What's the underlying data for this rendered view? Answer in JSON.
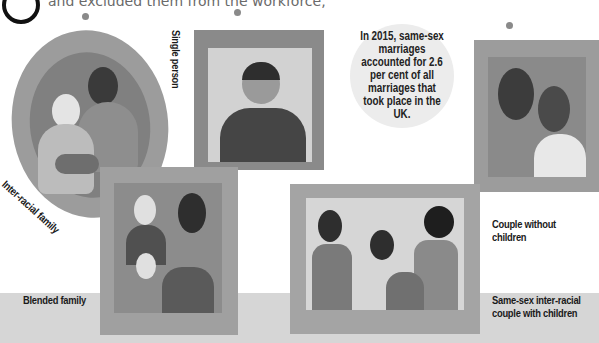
{
  "header": {
    "intro_text_clipped": "and excluded them from the workforce,"
  },
  "fact": {
    "text": "In 2015, same-sex marriages accounted for 2.6 per cent of all marriages that took place in the UK."
  },
  "frames": [
    {
      "id": "inter-racial",
      "label": "Inter-racial family"
    },
    {
      "id": "single",
      "label": "Single person"
    },
    {
      "id": "couple",
      "label": "Couple without children"
    },
    {
      "id": "blended",
      "label": "Blended family"
    },
    {
      "id": "same-sex",
      "label": "Same-sex inter-racial couple with children"
    }
  ],
  "colors": {
    "background": "#ffffff",
    "floor": "#d6d6d6",
    "frame": "#9a9a9a",
    "text": "#1a1a1a"
  }
}
